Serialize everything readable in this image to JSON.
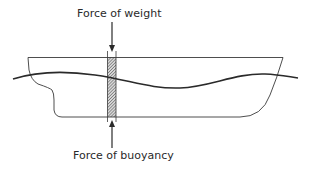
{
  "diagram": {
    "type": "ship-hull-force-diagram",
    "labels": {
      "weight": "Force of weight",
      "buoyancy": "Force of buoyancy"
    },
    "elements": [
      {
        "name": "ship-hull",
        "description": "Side profile outline of ship hull"
      },
      {
        "name": "waterline-wave",
        "description": "Wavy water surface crossing the hull"
      },
      {
        "name": "hatched-section",
        "description": "Vertical hatched slice of the hull"
      },
      {
        "name": "weight-arrow",
        "direction": "down",
        "label": "Force of weight"
      },
      {
        "name": "buoyancy-arrow",
        "direction": "up",
        "label": "Force of buoyancy"
      }
    ],
    "colors": {
      "line": "#3a3a3a",
      "wave": "#2a2a2a",
      "hatch": "#6a6a6a",
      "background": "#ffffff"
    }
  }
}
